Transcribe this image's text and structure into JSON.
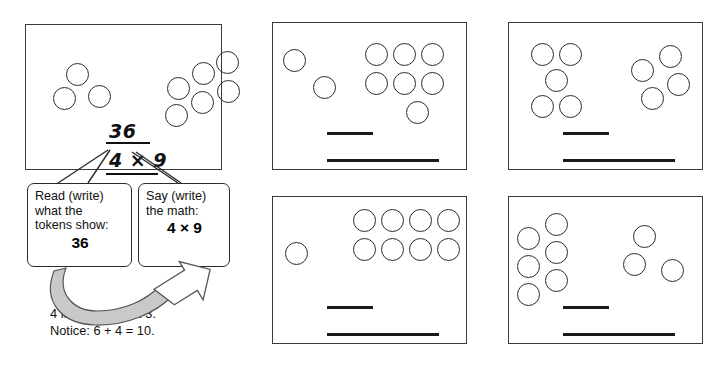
{
  "worksheet": {
    "title": "Token multiplication practice",
    "ink_color": "#2b2b2b",
    "arrow_fill": "#c9c9c9",
    "panels": [
      {
        "id": "example-panel",
        "kind": "example",
        "rect": [
          25,
          24,
          197,
          146
        ],
        "left_group_count": 3,
        "right_group_count": 6,
        "tokens": [
          [
            40,
            38
          ],
          [
            62,
            60
          ],
          [
            27,
            62
          ],
          [
            141,
            52
          ],
          [
            166,
            37
          ],
          [
            190,
            26
          ],
          [
            191,
            55
          ],
          [
            165,
            66
          ],
          [
            139,
            79
          ]
        ],
        "token_size": 23,
        "answer_top": "36",
        "answer_bottom": "4 × 9",
        "answer_top_pos": [
          83,
          95
        ],
        "answer_bottom_pos": [
          83,
          124
        ],
        "rule_top": [
          80,
          117,
          44
        ],
        "rule_bottom": [
          80,
          148,
          52
        ]
      },
      {
        "id": "practice-panel-1",
        "kind": "practice",
        "rect": [
          272,
          22,
          195,
          148
        ],
        "left_group_count": 2,
        "right_group_count": 7,
        "tokens": [
          [
            10,
            26
          ],
          [
            40,
            53
          ],
          [
            92,
            20
          ],
          [
            120,
            20
          ],
          [
            148,
            20
          ],
          [
            92,
            49
          ],
          [
            120,
            49
          ],
          [
            148,
            49
          ],
          [
            133,
            78
          ]
        ],
        "token_size": 23,
        "line_short": [
          54,
          109,
          46
        ],
        "line_long": [
          54,
          136,
          112
        ]
      },
      {
        "id": "practice-panel-2",
        "kind": "practice",
        "rect": [
          508,
          22,
          195,
          148
        ],
        "left_group_count": 5,
        "right_group_count": 4,
        "tokens": [
          [
            22,
            20
          ],
          [
            50,
            20
          ],
          [
            36,
            46
          ],
          [
            22,
            72
          ],
          [
            50,
            72
          ],
          [
            122,
            36
          ],
          [
            150,
            22
          ],
          [
            158,
            50
          ],
          [
            132,
            64
          ]
        ],
        "token_size": 23,
        "line_short": [
          54,
          109,
          46
        ],
        "line_long": [
          54,
          136,
          112
        ]
      },
      {
        "id": "practice-panel-3",
        "kind": "practice",
        "rect": [
          272,
          196,
          195,
          148
        ],
        "left_group_count": 1,
        "right_group_count": 8,
        "tokens": [
          [
            12,
            45
          ],
          [
            80,
            12
          ],
          [
            108,
            12
          ],
          [
            136,
            12
          ],
          [
            164,
            12
          ],
          [
            80,
            41
          ],
          [
            108,
            41
          ],
          [
            136,
            41
          ],
          [
            164,
            41
          ]
        ],
        "token_size": 23,
        "line_short": [
          54,
          109,
          46
        ],
        "line_long": [
          54,
          136,
          112
        ]
      },
      {
        "id": "practice-panel-4",
        "kind": "practice",
        "rect": [
          508,
          196,
          195,
          148
        ],
        "left_group_count": 6,
        "right_group_count": 3,
        "tokens": [
          [
            8,
            30
          ],
          [
            8,
            58
          ],
          [
            8,
            86
          ],
          [
            36,
            16
          ],
          [
            36,
            44
          ],
          [
            36,
            72
          ],
          [
            124,
            28
          ],
          [
            114,
            56
          ],
          [
            152,
            62
          ]
        ],
        "token_size": 23,
        "line_short": [
          54,
          109,
          46
        ],
        "line_long": [
          54,
          136,
          112
        ]
      }
    ],
    "callouts": [
      {
        "id": "read-callout",
        "rect": [
          27,
          183,
          105,
          84
        ],
        "lines": [
          "Read (write)",
          "what the",
          "tokens show:"
        ],
        "value": "36"
      },
      {
        "id": "say-callout",
        "rect": [
          138,
          183,
          92,
          84
        ],
        "lines": [
          "Say (write)",
          "the math:"
        ],
        "value": "4 × 9"
      }
    ],
    "caption": {
      "pos": [
        50,
        305
      ],
      "lines": [
        "4 is 1 more than 3.",
        "Notice:  6 + 4 = 10."
      ]
    }
  }
}
